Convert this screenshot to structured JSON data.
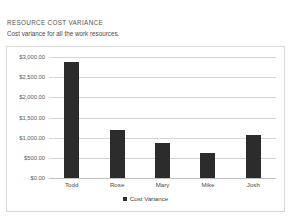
{
  "report": {
    "title": "RESOURCE COST VARIANCE",
    "subtitle": "Cost variance for all the work resources."
  },
  "colors": {
    "bar": "#2c2c2c",
    "gridline": "#d6d6d6",
    "frame_border": "#d9d9d9",
    "text": "#4a4a4a"
  },
  "chart_data": {
    "type": "bar",
    "title": "",
    "xlabel": "",
    "ylabel": "",
    "categories": [
      "Todd",
      "Rose",
      "Mary",
      "Mike",
      "Josh"
    ],
    "values": [
      2875,
      1200,
      875,
      625,
      1075
    ],
    "series": [
      {
        "name": "Cost Variance",
        "values": [
          2875,
          1200,
          875,
          625,
          1075
        ]
      }
    ],
    "ylim": [
      0,
      3000
    ],
    "yticks": [
      0,
      500,
      1000,
      1500,
      2000,
      2500,
      3000
    ],
    "ytick_labels": [
      "$0.00",
      "$500.00",
      "$1,000.00",
      "$1,500.00",
      "$2,000.00",
      "$2,500.00",
      "$3,000.00"
    ],
    "grid": true,
    "legend": {
      "position": "bottom",
      "entries": [
        "Cost Variance"
      ]
    }
  }
}
